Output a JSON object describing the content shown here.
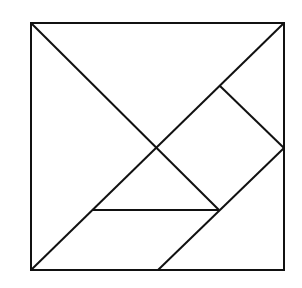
{
  "diagram": {
    "stroke_color": "#111111",
    "background": "#ffffff",
    "outer_square": {
      "x": 31,
      "y": 23,
      "w": 253,
      "h": 247
    },
    "lines": [
      {
        "id": "diag-main",
        "x1": 31,
        "y1": 270,
        "x2": 284,
        "y2": 23
      },
      {
        "id": "diag-top-left",
        "x1": 31,
        "y1": 23,
        "x2": 219,
        "y2": 210
      },
      {
        "id": "horizontal",
        "x1": 93,
        "y1": 210,
        "x2": 219,
        "y2": 210
      },
      {
        "id": "diag-bottom",
        "x1": 158,
        "y1": 270,
        "x2": 284,
        "y2": 148
      },
      {
        "id": "square-edge",
        "x1": 220,
        "y1": 86,
        "x2": 284,
        "y2": 148
      }
    ]
  }
}
